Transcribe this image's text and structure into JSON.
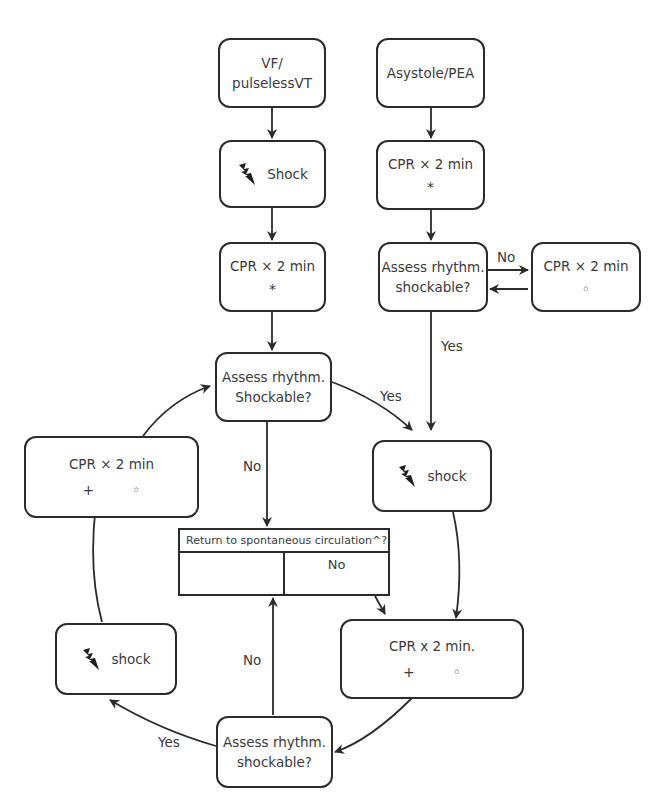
{
  "diagram": {
    "type": "flowchart",
    "colors": {
      "line": "#2b2b2b",
      "text": "#3a3a3a",
      "background": "#ffffff"
    }
  },
  "nodes": {
    "vf": {
      "line1": "VF/",
      "line2": "pulselessVT"
    },
    "asystole": {
      "label": "Asystole/PEA"
    },
    "shock_left_top": {
      "icon": "lightning-bolt-icon",
      "label": "Shock"
    },
    "cpr_left": {
      "label": "CPR × 2 min",
      "symbol": "*"
    },
    "cpr_right": {
      "label": "CPR × 2 min",
      "symbol": "*"
    },
    "assess_right": {
      "line1": "Assess rhythm.",
      "line2": "shockable?"
    },
    "cpr_side": {
      "label": "CPR × 2 min",
      "symbol": "◦"
    },
    "assess_center": {
      "line1": "Assess rhythm.",
      "line2": "Shockable?"
    },
    "cpr_loop_left": {
      "label": "CPR × 2 min",
      "symbol1": "+",
      "symbol2": "◦"
    },
    "shock_right": {
      "icon": "lightning-bolt-icon",
      "label": "shock"
    },
    "rosc": {
      "header": "Return to spontaneous circulation^?",
      "cell_left": "",
      "cell_right": "No"
    },
    "shock_loop_left": {
      "icon": "lightning-bolt-icon",
      "label": "shock"
    },
    "cpr_loop_right": {
      "label": "CPR x 2 min.",
      "symbol1": "+",
      "symbol2": "◦"
    },
    "assess_bottom": {
      "line1": "Assess rhythm.",
      "line2": "shockable?"
    }
  },
  "edge_labels": {
    "no_right_side": "No",
    "yes_right_down": "Yes",
    "yes_center_right": "Yes",
    "no_center_down": "No",
    "no_bottom_up": "No",
    "yes_bottom_left": "Yes"
  }
}
